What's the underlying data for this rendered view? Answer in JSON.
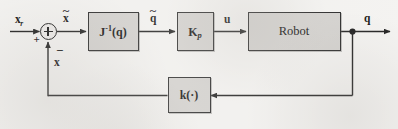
{
  "figure": {
    "type": "control-block-diagram",
    "background_color": "#f4f3f1",
    "block_fill_color": "#d4d2cf",
    "line_color": "#2a2a2a",
    "text_color": "#121212"
  },
  "signals": {
    "reference": {
      "base": "x",
      "subscript": "r",
      "accent": "none",
      "label": "x_r"
    },
    "error": {
      "base": "x",
      "subscript": "",
      "accent": "tilde",
      "label": "x-tilde"
    },
    "joint_error": {
      "base": "q",
      "subscript": "",
      "accent": "tilde",
      "label": "q-tilde"
    },
    "control": {
      "base": "u",
      "subscript": "",
      "accent": "none",
      "label": "u"
    },
    "output": {
      "base": "q",
      "subscript": "",
      "accent": "none",
      "label": "q"
    },
    "feedback": {
      "base": "x",
      "subscript": "",
      "accent": "none",
      "label": "x"
    }
  },
  "summing_junction": {
    "name": "summing-junction",
    "glyph": "plus-circle",
    "input_sign_left": "+",
    "input_sign_bottom": "−"
  },
  "blocks": [
    {
      "id": "jacobian-inverse",
      "main": "J",
      "superscript": "-1",
      "argument": "(q)",
      "full_label": "J^-1(q)",
      "style": "bold"
    },
    {
      "id": "proportional-gain",
      "main": "K",
      "subscript": "p",
      "full_label": "K_p",
      "style": "bold"
    },
    {
      "id": "robot",
      "main": "Robot",
      "full_label": "Robot",
      "style": "plain"
    },
    {
      "id": "forward-kinematics",
      "main": "k",
      "argument": "(·)",
      "full_label": "k(·)",
      "style": "bold"
    }
  ]
}
